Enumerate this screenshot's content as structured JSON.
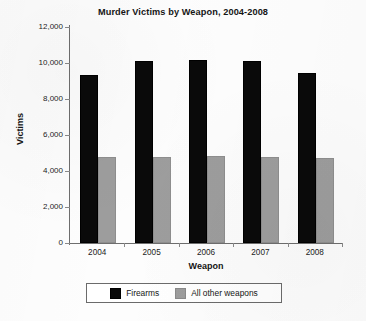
{
  "chart_data": {
    "type": "bar",
    "title": "Murder Victims by Weapon, 2004-2008",
    "xlabel": "Weapon",
    "ylabel": "Victims",
    "categories": [
      "2004",
      "2005",
      "2006",
      "2007",
      "2008"
    ],
    "series": [
      {
        "name": "Firearms",
        "color": "#0a0a0a",
        "values": [
          9350,
          10100,
          10170,
          10100,
          9450
        ]
      },
      {
        "name": "All other weapons",
        "color": "#9d9d9d",
        "values": [
          4800,
          4800,
          4850,
          4800,
          4750
        ]
      }
    ],
    "ylim": [
      0,
      12000
    ],
    "ytick_values": [
      0,
      2000,
      4000,
      6000,
      8000,
      10000,
      12000
    ],
    "ytick_labels": [
      "0",
      "2,000",
      "4,000",
      "6,000",
      "8,000",
      "10,000",
      "12,000"
    ],
    "grid": false,
    "legend_position": "bottom",
    "legend_entries": [
      "Firearms",
      "All other weapons"
    ]
  },
  "page": {
    "background_color": "#fdfdfd",
    "axis_color": "#6e6e6e",
    "text_color": "#151515"
  }
}
